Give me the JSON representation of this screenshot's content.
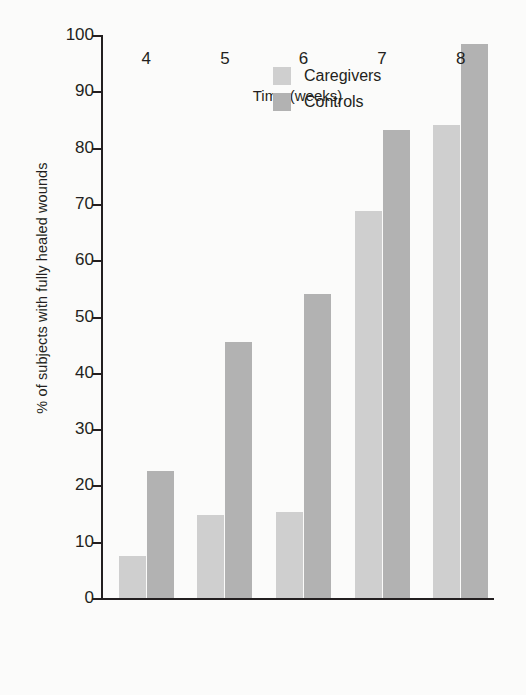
{
  "chart_data": {
    "type": "bar",
    "title": "",
    "xlabel": "Time (weeks)",
    "ylabel": "% of subjects with fully healed wounds",
    "categories": [
      "4",
      "5",
      "6",
      "7",
      "8"
    ],
    "ylim": [
      0,
      100
    ],
    "yticks": [
      0,
      10,
      20,
      30,
      40,
      50,
      60,
      70,
      80,
      90,
      100
    ],
    "ytick_labels": [
      "0",
      "10",
      "20",
      "30",
      "40",
      "50",
      "60",
      "70",
      "80",
      "90",
      "100"
    ],
    "grid": false,
    "legend_position": "top-left-inside",
    "series": [
      {
        "name": "Caregivers",
        "color": "#cfcfcf",
        "values": [
          7.5,
          14.8,
          15.2,
          68.8,
          84.0
        ]
      },
      {
        "name": "Controls",
        "color": "#b2b2b2",
        "values": [
          22.6,
          45.4,
          54.0,
          83.2,
          98.4
        ]
      }
    ]
  },
  "colors": {
    "axis": "#231f20",
    "background": "#fbfbfa",
    "caregivers": "#cfcfcf",
    "controls": "#b2b2b2"
  }
}
